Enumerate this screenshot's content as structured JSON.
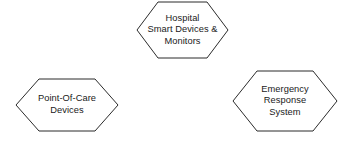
{
  "diagram": {
    "background_color": "#ffffff",
    "stroke_color": "#2b2b2b",
    "fill_color": "#ffffff",
    "text_color": "#1a1a1a",
    "shape": "hexagon",
    "nodes": [
      {
        "id": "hospital-smart-devices",
        "label": "Hospital\nSmart Devices &\nMonitors",
        "lines": [
          "Hospital",
          "Smart Devices &",
          "Monitors"
        ],
        "position": "top-center"
      },
      {
        "id": "point-of-care",
        "label": "Point-Of-Care\nDevices",
        "lines": [
          "Point-Of-Care",
          "Devices"
        ],
        "position": "bottom-left"
      },
      {
        "id": "emergency-response",
        "label": "Emergency\nResponse\nSystem",
        "lines": [
          "Emergency",
          "Response",
          "System"
        ],
        "position": "bottom-right"
      }
    ],
    "connectors": []
  }
}
